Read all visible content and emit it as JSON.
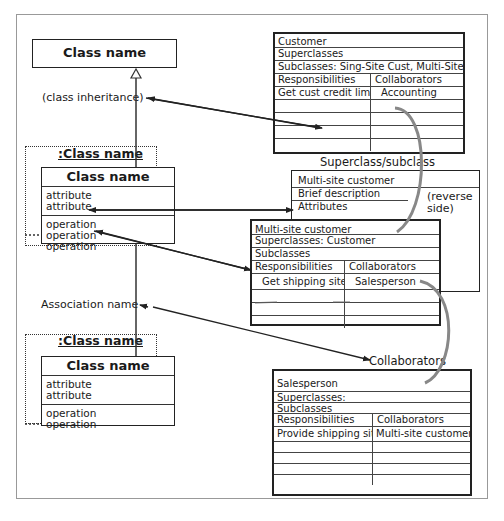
{
  "diagram": {
    "left_column": {
      "superclass": {
        "title": "Class name"
      },
      "inheritance_label": "(class inheritance)",
      "object1": {
        "object_name": ":Class name",
        "title": "Class name",
        "attributes": [
          "attribute",
          "attribute"
        ],
        "operations": [
          "operation",
          "operation",
          "operation"
        ]
      },
      "association_label": "Association name",
      "object2": {
        "object_name": ":Class name",
        "title": "Class name",
        "attributes": [
          "attribute",
          "attribute"
        ],
        "operations": [
          "operation",
          "operation"
        ]
      }
    },
    "crc_customer": {
      "name": "Customer",
      "superclasses": "Superclasses",
      "subclasses": "Subclasses: Sing-Site Cust, Multi-Site Cust.",
      "resp_header": "Responsibilities",
      "collab_header": "Collaborators",
      "rows": [
        [
          "Get cust credit limit",
          "Accounting"
        ]
      ]
    },
    "superclass_subclass_label": "Superclass/subclass",
    "crc_multisite_back": {
      "name": "Multi-site customer",
      "brief": "Brief description",
      "attributes": "Attributes",
      "reverse_note": "(reverse side)"
    },
    "crc_multisite": {
      "name": "Multi-site customer",
      "superclasses": "Superclasses: Customer",
      "subclasses": "Subclasses",
      "resp_header": "Responsibilities",
      "collab_header": "Collaborators",
      "rows": [
        [
          "Get shipping site",
          "Salesperson"
        ]
      ]
    },
    "collaborators_label": "Collaborators",
    "crc_salesperson": {
      "name": "Salesperson",
      "superclasses": "Superclasses:",
      "subclasses": "Subclasses",
      "resp_header": "Responsibilities",
      "collab_header": "Collaborators",
      "rows": [
        [
          "Provide shipping site",
          "Multi-site customer"
        ]
      ]
    }
  }
}
